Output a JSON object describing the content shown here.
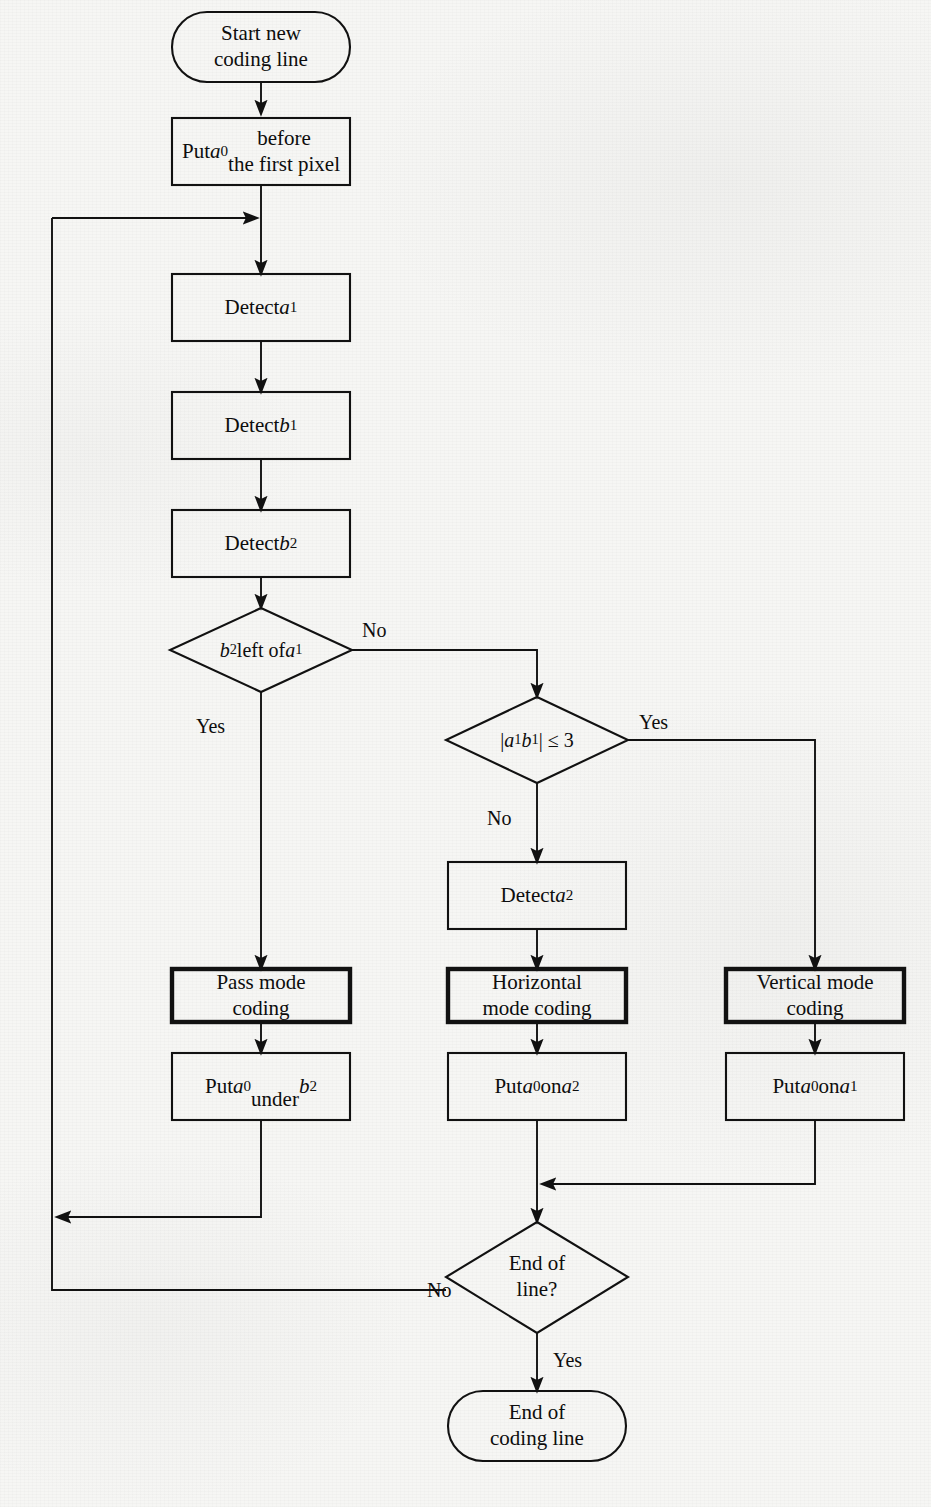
{
  "figure": {
    "kind": "flowchart",
    "background_color": "#f6f6f4",
    "line_color": "#111111",
    "text_color": "#0d0d0d"
  },
  "nodes": {
    "start": {
      "shape": "terminator",
      "label": "Start new\ncoding line"
    },
    "put_a0_first": {
      "shape": "process",
      "label": "Put a₀ before\nthe first pixel"
    },
    "detect_a1": {
      "shape": "process",
      "label": "Detect a₁"
    },
    "detect_b1": {
      "shape": "process",
      "label": "Detect b₁"
    },
    "detect_b2": {
      "shape": "process",
      "label": "Detect b₂"
    },
    "decide_b2_left_a1": {
      "shape": "decision",
      "label": "b₂ left of a₁"
    },
    "decide_a1b1_le3": {
      "shape": "decision",
      "label": "| a₁ b₁ | ≤ 3"
    },
    "detect_a2": {
      "shape": "process",
      "label": "Detect a₂"
    },
    "pass_mode": {
      "shape": "process-bold",
      "label": "Pass mode\ncoding"
    },
    "horizontal_mode": {
      "shape": "process-bold",
      "label": "Horizontal\nmode coding"
    },
    "vertical_mode": {
      "shape": "process-bold",
      "label": "Vertical mode\ncoding"
    },
    "put_a0_under_b2": {
      "shape": "process",
      "label": "Put a₀\nunder b₂"
    },
    "put_a0_on_a2": {
      "shape": "process",
      "label": "Put a₀ on a₂"
    },
    "put_a0_on_a1": {
      "shape": "process",
      "label": "Put a₀ on a₁"
    },
    "decide_end_of_line": {
      "shape": "decision",
      "label": "End of\nline?"
    },
    "end": {
      "shape": "terminator",
      "label": "End of\ncoding line"
    }
  },
  "edge_labels": {
    "b2_left_no": "No",
    "b2_left_yes": "Yes",
    "a1b1_yes": "Yes",
    "a1b1_no": "No",
    "end_of_line_no": "No",
    "end_of_line_yes": "Yes"
  }
}
